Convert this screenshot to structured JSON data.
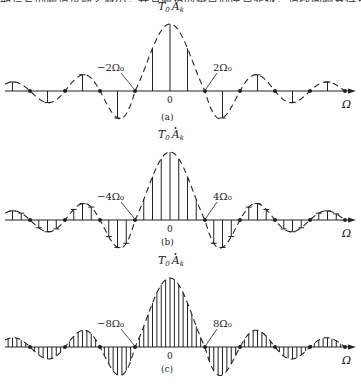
{
  "page": {
    "top_text_fragment": "期信号的频谱也随之减小，并且频谱的零点向原点靠拢，谱线间隔变得更加密集。"
  },
  "colors": {
    "ink": "#222222",
    "background": "#ffffff"
  },
  "chart_data": [
    {
      "type": "line_spectrum",
      "caption": "(a)",
      "amplitude_label_T": "T",
      "amplitude_label_sub0": "0",
      "amplitude_label_A": "A",
      "amplitude_label_subk": "k",
      "x_axis_label": "Ω",
      "origin_label": "0",
      "zero_left_label": "−2Ω₀",
      "zero_right_label": "2Ω₀",
      "harmonics_per_zero": 2,
      "envelope": "dashed sinc",
      "geometry": {
        "axis_y": 91,
        "peak_y": 24,
        "center_x": 170,
        "zero_spacing": 35,
        "x_start": 5,
        "x_end": 350,
        "caption_y": 120,
        "label_top_y": 10
      }
    },
    {
      "type": "line_spectrum",
      "caption": "(b)",
      "amplitude_label_T": "T",
      "amplitude_label_sub0": "0",
      "amplitude_label_A": "A",
      "amplitude_label_subk": "k",
      "x_axis_label": "Ω",
      "origin_label": "0",
      "zero_left_label": "−4Ω₀",
      "zero_right_label": "4Ω₀",
      "harmonics_per_zero": 4,
      "envelope": "dashed sinc",
      "geometry": {
        "axis_y": 220,
        "peak_y": 152,
        "center_x": 170,
        "zero_spacing": 35,
        "x_start": 5,
        "x_end": 350,
        "caption_y": 245,
        "label_top_y": 138
      }
    },
    {
      "type": "line_spectrum",
      "caption": "(c)",
      "amplitude_label_T": "T",
      "amplitude_label_sub0": "0",
      "amplitude_label_A": "A",
      "amplitude_label_subk": "k",
      "x_axis_label": "Ω",
      "origin_label": "0",
      "zero_left_label": "−8Ω₀",
      "zero_right_label": "8Ω₀",
      "harmonics_per_zero": 8,
      "envelope": "dashed sinc",
      "geometry": {
        "axis_y": 347,
        "peak_y": 278,
        "center_x": 170,
        "zero_spacing": 35,
        "x_start": 5,
        "x_end": 350,
        "caption_y": 372,
        "label_top_y": 264
      }
    }
  ]
}
